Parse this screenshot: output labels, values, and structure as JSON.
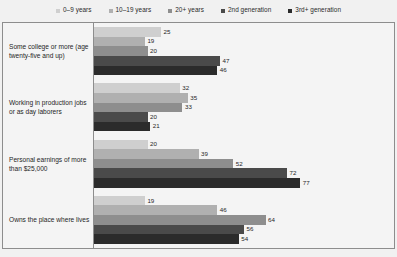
{
  "legend": {
    "position": "top-center",
    "items": [
      {
        "label": "0–9 years",
        "color": "#cfcfcf"
      },
      {
        "label": "10–19 years",
        "color": "#b0b0b0"
      },
      {
        "label": "20+ years",
        "color": "#8e8e8e"
      },
      {
        "label": "2nd generation",
        "color": "#4a4a4a"
      },
      {
        "label": "3rd+ generation",
        "color": "#2b2b2b"
      }
    ]
  },
  "chart_data": {
    "type": "bar",
    "orientation": "horizontal",
    "title": "",
    "subtitle": "",
    "xlabel": "",
    "ylabel": "",
    "xlim": [
      0,
      100
    ],
    "grid": false,
    "value_labels": true,
    "legend_position": "top-center",
    "categories": [
      "Some college or more (age twenty-five and up)",
      "Working in production jobs or as day laborers",
      "Personal earnings of more than $25,000",
      "Owns the place where lives"
    ],
    "series": [
      {
        "name": "0–9 years",
        "color": "#cfcfcf",
        "values": [
          25,
          32,
          20,
          19
        ]
      },
      {
        "name": "10–19 years",
        "color": "#b0b0b0",
        "values": [
          19,
          35,
          39,
          46
        ]
      },
      {
        "name": "20+ years",
        "color": "#8e8e8e",
        "values": [
          20,
          33,
          52,
          64
        ]
      },
      {
        "name": "2nd generation",
        "color": "#4a4a4a",
        "values": [
          47,
          20,
          72,
          56
        ]
      },
      {
        "name": "3rd+ generation",
        "color": "#2b2b2b",
        "values": [
          46,
          21,
          77,
          54
        ]
      }
    ]
  }
}
